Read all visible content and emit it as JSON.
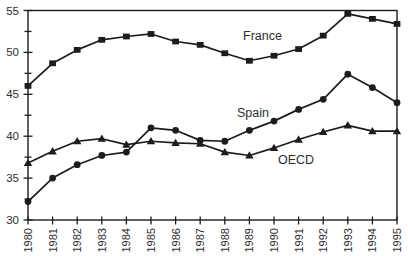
{
  "figure": {
    "background": "#ffffff",
    "ink_color": "#1c1c1c",
    "text_color": "#2e2e2e"
  },
  "chart_data": {
    "type": "line",
    "title": "",
    "xlabel": "",
    "ylabel": "",
    "x": [
      1980,
      1981,
      1982,
      1983,
      1984,
      1985,
      1986,
      1987,
      1988,
      1989,
      1990,
      1991,
      1992,
      1993,
      1994,
      1995
    ],
    "x_tick_labels": [
      "1980",
      "1981",
      "1982",
      "1983",
      "1984",
      "1985",
      "1986",
      "1987",
      "1988",
      "1989",
      "1990",
      "1991",
      "1992",
      "1993",
      "1994",
      "1995"
    ],
    "series": [
      {
        "name": "France",
        "marker": "square",
        "values": [
          46.0,
          48.7,
          50.3,
          51.5,
          51.9,
          52.2,
          51.3,
          50.9,
          49.9,
          49.0,
          49.6,
          50.4,
          52.0,
          54.6,
          54.0,
          53.4
        ],
        "label": "France",
        "label_anchor": {
          "x": 243,
          "y": 40
        }
      },
      {
        "name": "Spain",
        "marker": "circle",
        "values": [
          32.2,
          35.0,
          36.6,
          37.7,
          38.1,
          41.0,
          40.7,
          39.5,
          39.4,
          40.7,
          41.8,
          43.2,
          44.4,
          47.4,
          45.8,
          44.0
        ],
        "label": "Spain",
        "label_anchor": {
          "x": 237,
          "y": 117
        }
      },
      {
        "name": "OECD",
        "marker": "triangle",
        "values": [
          36.8,
          38.2,
          39.4,
          39.7,
          39.0,
          39.4,
          39.2,
          39.1,
          38.1,
          37.7,
          38.6,
          39.6,
          40.5,
          41.3,
          40.6,
          40.6
        ],
        "label": "OECD",
        "label_anchor": {
          "x": 278,
          "y": 164
        }
      }
    ],
    "ylim": [
      30,
      55
    ],
    "y_major_ticks": [
      30,
      35,
      40,
      45,
      50,
      55
    ],
    "y_tick_labels": [
      "30",
      "35",
      "40",
      "45",
      "50",
      "55"
    ],
    "y_minor_step": 2.5,
    "grid": false,
    "legend_position": "inline-labels",
    "x_tick_label_rotation": -90,
    "plot_box": {
      "left": 28,
      "top": 10.5,
      "right": 397,
      "bottom": 220
    }
  }
}
